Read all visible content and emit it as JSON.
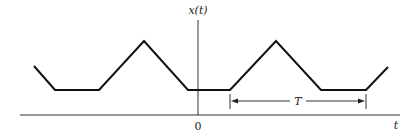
{
  "figure": {
    "type": "periodic-signal-diagram",
    "y_axis_label": "x(t)",
    "x_axis_label": "t",
    "origin_label": "0",
    "period_label": "T",
    "colors": {
      "background": "#ffffff",
      "waveform": "#111111",
      "axes": "#333333",
      "annotation": "#222222"
    }
  },
  "geometry": {
    "t_axis": {
      "x1": 20,
      "y1": 115,
      "x2": 400,
      "y2": 115
    },
    "x_axis": {
      "x1": 198,
      "y1": 20,
      "x2": 198,
      "y2": 115
    },
    "waveform_points": "34,66 55,90 99,90 144,41 188,90 230,90 276,41 321,90 366,90 388,67",
    "period_marker": {
      "x_start": 230,
      "x_end": 366,
      "y": 101,
      "tick_top": 94,
      "tick_bottom": 109
    }
  },
  "labels": {
    "y_axis": {
      "text": "x(t)",
      "x": 198,
      "y": 14
    },
    "origin": {
      "text": "0",
      "x": 198,
      "y": 130
    },
    "t_axis": {
      "text": "t",
      "x": 396,
      "y": 129
    },
    "period": {
      "text": "T",
      "x": 298,
      "y": 105
    }
  }
}
